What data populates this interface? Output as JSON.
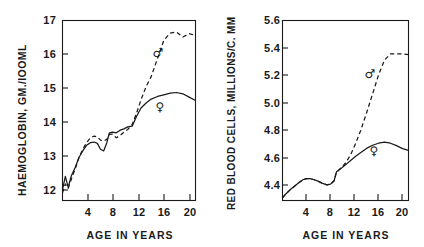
{
  "figure": {
    "panels": [
      "haemoglobin",
      "red-blood-cells"
    ]
  },
  "chart_data": [
    {
      "type": "line",
      "id": "haemoglobin",
      "title": "",
      "ylabel": "HAEMOGLOBIN, GM./IOOML",
      "xlabel": "AGE IN YEARS",
      "xlim": [
        0,
        21
      ],
      "ylim": [
        11.55,
        17
      ],
      "xticks": [
        4,
        8,
        12,
        16,
        20
      ],
      "xticklabels": [
        "4",
        "8",
        "12",
        "16",
        "20"
      ],
      "yticks": [
        12,
        13,
        14,
        15,
        16,
        17
      ],
      "yticklabels": [
        "12",
        "13",
        "14",
        "15",
        "16",
        "17"
      ],
      "grid": false,
      "legend": "inline-symbols",
      "annotations": [
        {
          "label": "male-symbol",
          "text": "♂",
          "x": 15.1,
          "y": 16.0
        },
        {
          "label": "female-symbol",
          "text": "♀",
          "x": 15.4,
          "y": 14.38
        }
      ],
      "series": [
        {
          "name": "♀ female",
          "style": "solid",
          "x": [
            0.0,
            0.45,
            0.9,
            1.4,
            2.0,
            2.6,
            3.2,
            3.8,
            4.4,
            5.0,
            5.5,
            6.0,
            6.5,
            7.0,
            7.4,
            7.9,
            8.5,
            9.1,
            9.7,
            10.3,
            11.0,
            11.7,
            12.4,
            13.2,
            14.0,
            15.0,
            16.0,
            17.0,
            18.0,
            19.0,
            20.0,
            21.0
          ],
          "y": [
            11.88,
            12.28,
            11.95,
            12.3,
            12.55,
            12.85,
            13.05,
            13.22,
            13.3,
            13.32,
            13.28,
            13.1,
            13.05,
            13.3,
            13.6,
            13.62,
            13.6,
            13.68,
            13.72,
            13.78,
            13.8,
            14.1,
            14.35,
            14.5,
            14.62,
            14.7,
            14.75,
            14.8,
            14.82,
            14.78,
            14.68,
            14.58
          ]
        },
        {
          "name": "♂ male",
          "style": "dashed",
          "x": [
            0.0,
            0.45,
            0.9,
            1.4,
            2.0,
            2.6,
            3.2,
            3.8,
            4.4,
            5.0,
            5.5,
            6.0,
            6.5,
            7.0,
            7.4,
            7.9,
            8.5,
            9.1,
            9.7,
            10.3,
            11.0,
            11.7,
            12.4,
            13.2,
            14.0,
            15.0,
            16.0,
            17.0,
            18.0,
            19.0,
            20.0,
            21.0
          ],
          "y": [
            11.78,
            12.05,
            11.92,
            12.2,
            12.5,
            12.85,
            13.1,
            13.3,
            13.45,
            13.5,
            13.48,
            13.38,
            13.35,
            13.4,
            13.55,
            13.56,
            13.45,
            13.52,
            13.62,
            13.7,
            13.85,
            14.2,
            14.6,
            15.0,
            15.3,
            15.85,
            16.4,
            16.62,
            16.65,
            16.5,
            16.6,
            16.55
          ]
        }
      ]
    },
    {
      "type": "line",
      "id": "red-blood-cells",
      "title": "",
      "ylabel": "RED BLOOD CELLS, MILLIONS/C. MM",
      "xlabel": "AGE IN YEARS",
      "xlim": [
        0,
        21
      ],
      "ylim": [
        4.28,
        5.6
      ],
      "xticks": [
        4,
        8,
        12,
        16,
        20
      ],
      "xticklabels": [
        "4",
        "8",
        "12",
        "16",
        "20"
      ],
      "yticks": [
        4.4,
        4.6,
        4.8,
        5.0,
        5.2,
        5.4,
        5.6
      ],
      "yticklabels": [
        "4.4",
        "4.6",
        "4.8",
        "5.0",
        "5.2",
        "5.4",
        "5.6"
      ],
      "grid": false,
      "legend": "inline-symbols",
      "annotations": [
        {
          "label": "male-symbol",
          "text": "♂",
          "x": 14.6,
          "y": 5.21
        },
        {
          "label": "female-symbol",
          "text": "♀",
          "x": 15.3,
          "y": 4.655
        }
      ],
      "series": [
        {
          "name": "♀ female",
          "style": "solid",
          "x": [
            0.0,
            0.6,
            1.3,
            2.0,
            2.7,
            3.4,
            4.0,
            4.6,
            5.3,
            6.0,
            6.7,
            7.4,
            8.0,
            8.6,
            9.0,
            9.3,
            9.9,
            10.6,
            11.4,
            12.2,
            13.0,
            14.0,
            15.0,
            16.0,
            17.0,
            18.0,
            19.0,
            20.0,
            21.0
          ],
          "y": [
            4.3,
            4.33,
            4.36,
            4.385,
            4.41,
            4.432,
            4.44,
            4.44,
            4.432,
            4.42,
            4.405,
            4.395,
            4.4,
            4.425,
            4.49,
            4.5,
            4.52,
            4.545,
            4.575,
            4.605,
            4.63,
            4.662,
            4.685,
            4.7,
            4.708,
            4.7,
            4.682,
            4.66,
            4.648
          ]
        },
        {
          "name": "♂ male",
          "style": "dashed",
          "x": [
            0.0,
            0.6,
            1.3,
            2.0,
            2.7,
            3.4,
            4.0,
            4.6,
            5.3,
            6.0,
            6.7,
            7.4,
            8.0,
            8.6,
            9.0,
            9.3,
            9.9,
            10.6,
            11.4,
            12.2,
            13.0,
            14.0,
            15.0,
            16.0,
            17.0,
            18.0,
            19.0,
            20.0,
            21.0
          ],
          "y": [
            4.3,
            4.33,
            4.36,
            4.385,
            4.41,
            4.432,
            4.44,
            4.44,
            4.432,
            4.42,
            4.405,
            4.395,
            4.4,
            4.425,
            4.49,
            4.5,
            4.525,
            4.56,
            4.62,
            4.7,
            4.79,
            4.92,
            5.06,
            5.2,
            5.31,
            5.355,
            5.355,
            5.355,
            5.35
          ]
        }
      ]
    }
  ]
}
